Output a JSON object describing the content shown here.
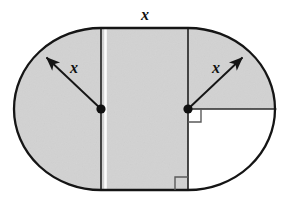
{
  "figure": {
    "type": "geometry-diagram",
    "canvas": {
      "width": 288,
      "height": 198
    },
    "colors": {
      "shaded_fill": "#d2d2d2",
      "unshaded_fill": "#ffffff",
      "outline": "#151515",
      "inner_line": "#2a2a2a",
      "arrow": "#151515",
      "label_text": "#111111",
      "right_angle_mark": "#5a5a5a",
      "gap_highlight": "#fafafa",
      "page_background": "#ffffff"
    },
    "labels": {
      "top_length": "x",
      "left_radius": "x",
      "right_radius": "x"
    },
    "label_positions": {
      "top_length": {
        "x": 145,
        "y": 20
      },
      "left_radius": {
        "x": 74,
        "y": 73
      },
      "right_radius": {
        "x": 216,
        "y": 73
      }
    },
    "geometry": {
      "outline_left_edge_x": 14,
      "outline_right_edge_x": 275,
      "outline_top_y": 28,
      "outline_bottom_y": 190,
      "axis_y": 109,
      "left_center": {
        "x": 101,
        "y": 109
      },
      "right_center": {
        "x": 188,
        "y": 109
      },
      "radius_x": 87,
      "radius_y": 81,
      "left_divider_x": 101,
      "right_divider_x": 188
    },
    "arrows": [
      {
        "name": "left-radius-arrow",
        "from": {
          "x": 101,
          "y": 109
        },
        "to": {
          "x": 44,
          "y": 55
        },
        "label": "x"
      },
      {
        "name": "right-radius-arrow",
        "from": {
          "x": 188,
          "y": 109
        },
        "to": {
          "x": 245,
          "y": 55
        },
        "label": "x"
      }
    ],
    "segments": [
      {
        "name": "top-chord",
        "from": {
          "x": 101,
          "y": 28
        },
        "to": {
          "x": 188,
          "y": 28
        }
      },
      {
        "name": "bottom-chord",
        "from": {
          "x": 101,
          "y": 190
        },
        "to": {
          "x": 188,
          "y": 190
        }
      },
      {
        "name": "left-vertical-divider",
        "from": {
          "x": 101,
          "y": 28
        },
        "to": {
          "x": 101,
          "y": 190
        }
      },
      {
        "name": "right-vertical-divider",
        "from": {
          "x": 188,
          "y": 28
        },
        "to": {
          "x": 188,
          "y": 190
        }
      },
      {
        "name": "right-horizontal-radius",
        "from": {
          "x": 188,
          "y": 109
        },
        "to": {
          "x": 275,
          "y": 109
        }
      }
    ],
    "right_angle_marks": [
      {
        "name": "upper-right-angle-mark",
        "corner": {
          "x": 188,
          "y": 109
        },
        "direction": "down-right",
        "size": 13
      },
      {
        "name": "lower-right-angle-mark",
        "corner": {
          "x": 188,
          "y": 190
        },
        "direction": "up-left",
        "size": 13
      }
    ],
    "shaded_regions": [
      "left-semicircle",
      "middle-rectangle",
      "right-upper-quarter"
    ],
    "unshaded_regions": [
      "right-lower-quarter"
    ]
  }
}
